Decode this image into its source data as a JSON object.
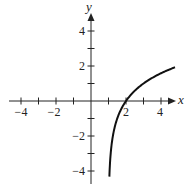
{
  "chart_data": {
    "type": "line",
    "title": "",
    "xlabel": "x",
    "ylabel": "y",
    "xlim": [
      -5,
      5
    ],
    "ylim": [
      -5,
      5
    ],
    "grid": false,
    "x_ticks": [
      -4,
      -3,
      -2,
      -1,
      1,
      2,
      3,
      4
    ],
    "y_ticks": [
      -4,
      -3,
      -2,
      -1,
      1,
      2,
      3,
      4
    ],
    "x_tick_labels": [
      "-4",
      "-2",
      "2",
      "4"
    ],
    "y_tick_labels": [
      "4",
      "2",
      "-2",
      "-4"
    ],
    "series": [
      {
        "name": "f(x)",
        "description": "logarithmic curve with vertical asymptote at x = 1, x-intercept at (2, 0)",
        "x": [
          1.05,
          1.1,
          1.25,
          1.5,
          2,
          2.5,
          3,
          3.5,
          4,
          4.5,
          4.8
        ],
        "y": [
          -4.32,
          -3.32,
          -2.0,
          -1.0,
          0.0,
          0.58,
          1.0,
          1.32,
          1.58,
          1.81,
          1.93
        ]
      }
    ]
  },
  "labels": {
    "x_axis": "x",
    "y_axis": "y",
    "x_tick_neg4": "−4",
    "x_tick_neg2": "−2",
    "x_tick_2": "2",
    "x_tick_4": "4",
    "y_tick_4": "4",
    "y_tick_2": "2",
    "y_tick_neg2": "−2",
    "y_tick_neg4": "−4"
  }
}
